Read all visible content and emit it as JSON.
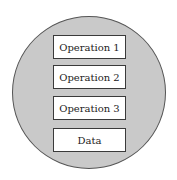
{
  "diagram": {
    "type": "encapsulation",
    "container": {
      "shape": "circle",
      "fill": "#c9c9c9",
      "stroke": "#555555"
    },
    "boxes": [
      {
        "label": "Operation 1"
      },
      {
        "label": "Operation 2"
      },
      {
        "label": "Operation 3"
      },
      {
        "label": "Data"
      }
    ]
  }
}
